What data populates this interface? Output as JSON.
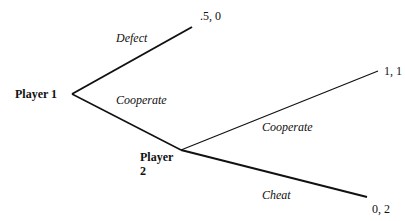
{
  "diagram": {
    "type": "game-tree",
    "line_color": "#111111",
    "nodes": {
      "player1": {
        "label": "Player 1"
      },
      "player2": {
        "label_line1": "Player",
        "label_line2": "2"
      }
    },
    "actions": {
      "p1_defect": "Defect",
      "p1_cooperate": "Cooperate",
      "p2_cooperate": "Cooperate",
      "p2_cheat": "Cheat"
    },
    "payoffs": {
      "defect": ".5, 0",
      "cooperate_cooperate": "1, 1",
      "cooperate_cheat": "0, 2"
    }
  }
}
